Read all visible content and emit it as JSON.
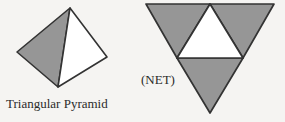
{
  "figure": {
    "background_color": "#f5f4f2",
    "shaded_fill": "#969696",
    "light_fill": "#ffffff",
    "outline_color": "#333333",
    "solid": {
      "caption": "Triangular Pyramid",
      "shape_name": "tetrahedron",
      "vertices": {
        "apex": [
          70,
          8
        ],
        "left": [
          17,
          52
        ],
        "right": [
          107,
          57
        ],
        "bottom": [
          58,
          87
        ]
      },
      "faces": [
        {
          "name": "left-face",
          "fill": "shaded",
          "points": "70,8 17,52 58,87"
        },
        {
          "name": "right-face",
          "fill": "light",
          "points": "70,8 107,57 58,87"
        }
      ],
      "caption_position": [
        6,
        108
      ],
      "caption_font_size": 13
    },
    "net": {
      "caption": "(NET)",
      "shape_name": "triangular-pyramid-net",
      "vertices": {
        "top_left": [
          146,
          4
        ],
        "top_right": [
          274,
          4
        ],
        "bottom": [
          210,
          113
        ],
        "top_mid": [
          210,
          4
        ],
        "left_mid": [
          177,
          58
        ],
        "right_mid": [
          243,
          58
        ]
      },
      "faces": [
        {
          "name": "left-face",
          "fill": "shaded",
          "points": "146,4 210,4 177,58"
        },
        {
          "name": "right-face",
          "fill": "shaded",
          "points": "210,4 274,4 243,58"
        },
        {
          "name": "bottom-face",
          "fill": "shaded",
          "points": "177,58 243,58 210,113"
        },
        {
          "name": "center-base-face",
          "fill": "light",
          "points": "210,4 243,58 177,58"
        }
      ],
      "caption_position": [
        141,
        84
      ],
      "caption_font_size": 13
    }
  }
}
